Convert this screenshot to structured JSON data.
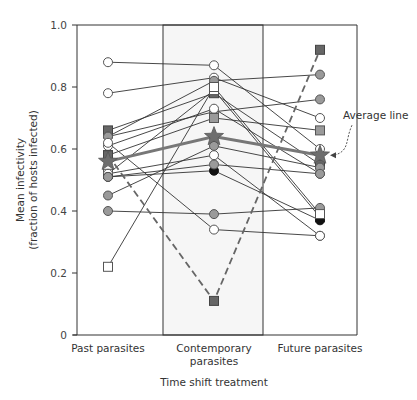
{
  "chart_data": {
    "type": "line",
    "title": "",
    "xlabel": "Time shift treatment",
    "ylabel": "Mean infectivity (fraction of hosts infected)",
    "ylabel_lines": [
      "Mean infectivity",
      "(fraction of hosts infected)"
    ],
    "ylim": [
      0,
      1.0
    ],
    "yticks": [
      0,
      0.2,
      0.4,
      0.6,
      0.8,
      1.0
    ],
    "ytick_labels": [
      "0",
      "0.2",
      "0.4",
      "0.6",
      "0.8",
      "1.0"
    ],
    "categories": [
      "Past parasites",
      "Contemporary parasites",
      "Future parasites"
    ],
    "category_label_lines": [
      [
        "Past parasites"
      ],
      [
        "Contemporary",
        "parasites"
      ],
      [
        "Future parasites"
      ]
    ],
    "grid": false,
    "highlighted_category": "Contemporary parasites",
    "annotation": {
      "text": "Average line",
      "points_to": "average series at Future parasites"
    },
    "series": [
      {
        "name": "pop1",
        "marker": "circle-open",
        "values": [
          0.88,
          0.87,
          0.6
        ]
      },
      {
        "name": "pop2",
        "marker": "circle-open",
        "values": [
          0.78,
          0.83,
          0.7
        ]
      },
      {
        "name": "pop3",
        "marker": "square-dark",
        "values": [
          0.66,
          0.78,
          0.55
        ]
      },
      {
        "name": "pop4",
        "marker": "circle-grey",
        "values": [
          0.64,
          0.82,
          0.84
        ]
      },
      {
        "name": "pop5",
        "marker": "circle-grey",
        "values": [
          0.64,
          0.72,
          0.76
        ]
      },
      {
        "name": "pop6",
        "marker": "circle-open",
        "values": [
          0.61,
          0.73,
          0.52
        ]
      },
      {
        "name": "pop7",
        "marker": "square-grey",
        "values": [
          0.58,
          0.7,
          0.66
        ]
      },
      {
        "name": "pop8",
        "marker": "square-open",
        "values": [
          0.52,
          0.79,
          0.38
        ]
      },
      {
        "name": "pop9",
        "marker": "circle-open",
        "values": [
          0.52,
          0.58,
          0.32
        ]
      },
      {
        "name": "pop10",
        "marker": "circle-black",
        "values": [
          0.51,
          0.53,
          0.37
        ]
      },
      {
        "name": "pop11",
        "marker": "circle-grey",
        "values": [
          0.45,
          0.61,
          0.54
        ]
      },
      {
        "name": "pop12",
        "marker": "circle-grey",
        "values": [
          0.4,
          0.39,
          0.41
        ]
      },
      {
        "name": "pop13",
        "marker": "square-open",
        "values": [
          0.22,
          0.8,
          0.39
        ]
      },
      {
        "name": "pop14",
        "marker": "circle-open",
        "values": [
          0.62,
          0.34,
          0.32
        ]
      },
      {
        "name": "pop15",
        "marker": "circle-grey",
        "values": [
          0.51,
          0.55,
          0.52
        ]
      },
      {
        "name": "dashed",
        "marker": "square-dark",
        "style": "dashed",
        "values": [
          0.58,
          0.11,
          0.92
        ]
      },
      {
        "name": "Average line",
        "marker": "star",
        "style": "thick",
        "values": [
          0.56,
          0.64,
          0.58
        ]
      }
    ]
  }
}
